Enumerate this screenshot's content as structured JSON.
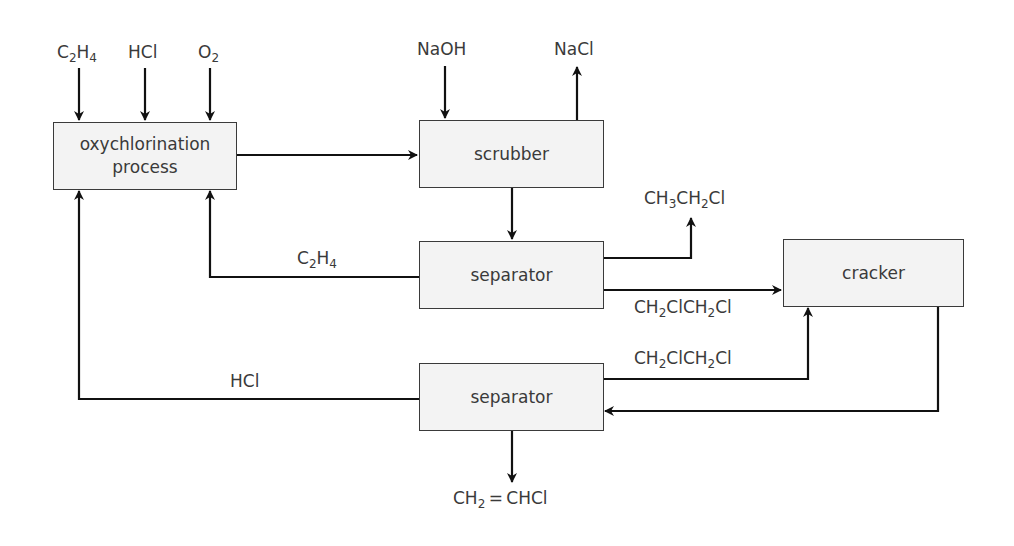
{
  "diagram": {
    "type": "process-flowchart",
    "boxes": {
      "oxychlorination": "oxychlorination process",
      "scrubber": "scrubber",
      "separator_1": "separator",
      "cracker": "cracker",
      "separator_2": "separator"
    },
    "inputs": {
      "c2h4": {
        "base": "C",
        "s1": "2",
        "mid": "H",
        "s2": "4"
      },
      "hcl": "HCl",
      "o2": {
        "base": "O",
        "s1": "2"
      },
      "naoh": "NaOH"
    },
    "outputs": {
      "nacl": "NaCl",
      "ethyl_chloride": {
        "p1": "CH",
        "s1": "3",
        "p2": "CH",
        "s2": "2",
        "p3": "Cl"
      },
      "vinyl_chloride": {
        "p1": "CH",
        "s1": "2",
        "p2": " = CHCl"
      }
    },
    "streams": {
      "recycle_c2h4": {
        "base": "C",
        "s1": "2",
        "mid": "H",
        "s2": "4"
      },
      "recycle_hcl": "HCl",
      "dce_to_cracker": {
        "p1": "CH",
        "s1": "2",
        "p2": "ClCH",
        "s2": "2",
        "p3": "Cl"
      },
      "dce_recycle": {
        "p1": "CH",
        "s1": "2",
        "p2": "ClCH",
        "s2": "2",
        "p3": "Cl"
      }
    },
    "connections": [
      {
        "from": "C2H4",
        "to": "oxychlorination process"
      },
      {
        "from": "HCl",
        "to": "oxychlorination process"
      },
      {
        "from": "O2",
        "to": "oxychlorination process"
      },
      {
        "from": "oxychlorination process",
        "to": "scrubber"
      },
      {
        "from": "NaOH",
        "to": "scrubber"
      },
      {
        "from": "scrubber",
        "to": "NaCl"
      },
      {
        "from": "scrubber",
        "to": "separator (1)"
      },
      {
        "from": "separator (1)",
        "to": "CH3CH2Cl"
      },
      {
        "from": "separator (1)",
        "to": "oxychlorination process",
        "label": "C2H4"
      },
      {
        "from": "separator (1)",
        "to": "cracker",
        "label": "CH2ClCH2Cl"
      },
      {
        "from": "cracker",
        "to": "separator (2)"
      },
      {
        "from": "separator (2)",
        "to": "cracker",
        "label": "CH2ClCH2Cl"
      },
      {
        "from": "separator (2)",
        "to": "oxychlorination process",
        "label": "HCl"
      },
      {
        "from": "separator (2)",
        "to": "CH2=CHCl"
      }
    ]
  }
}
